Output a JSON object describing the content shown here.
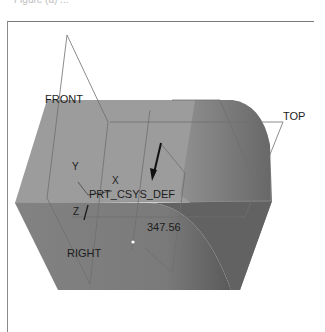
{
  "caption": "Figure (a) ...",
  "viewport": {
    "datum_planes": [
      {
        "label": "FRONT"
      },
      {
        "label": "TOP"
      },
      {
        "label": "RIGHT"
      }
    ],
    "csys": {
      "label": "PRT_CSYS_DEF",
      "axes": {
        "x": "X",
        "y": "Y",
        "z": "Z"
      }
    },
    "dimension": {
      "value": "347.56"
    },
    "colors": {
      "top_face": "#9c9c9c",
      "front_face": "#7e7e7e",
      "curved_face": "#6a6a6a",
      "plane_edge": "#6e6e6e",
      "frame": "#7a7a7a"
    }
  }
}
